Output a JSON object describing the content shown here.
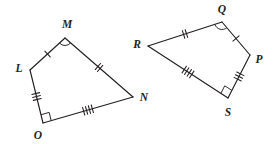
{
  "figure": {
    "stroke_color": "#231f20",
    "background_color": "#ffffff",
    "width": 273,
    "height": 144
  },
  "shapes": [
    {
      "name": "quadrilateral-lmno",
      "vertices": [
        {
          "label": "M",
          "x": 65,
          "y": 38,
          "label_x": 67,
          "label_y": 25
        },
        {
          "label": "N",
          "x": 133,
          "y": 97,
          "label_x": 144,
          "label_y": 98
        },
        {
          "label": "O",
          "x": 43,
          "y": 123,
          "label_x": 38,
          "label_y": 136
        },
        {
          "label": "L",
          "x": 30,
          "y": 70,
          "label_x": 19,
          "label_y": 69
        }
      ],
      "edges": [
        {
          "name": "edge-LM",
          "from": "L",
          "to": "M",
          "ticks": 1
        },
        {
          "name": "edge-MN",
          "from": "M",
          "to": "N",
          "ticks": 2
        },
        {
          "name": "edge-NO",
          "from": "N",
          "to": "O",
          "ticks": 4
        },
        {
          "name": "edge-OL",
          "from": "O",
          "to": "L",
          "ticks": 3
        }
      ],
      "angle_marks": [
        {
          "name": "angle-arc-M",
          "vertex": "M",
          "type": "arc"
        },
        {
          "name": "right-angle-O",
          "vertex": "O",
          "type": "right-angle"
        }
      ]
    },
    {
      "name": "quadrilateral-qpsr",
      "vertices": [
        {
          "label": "Q",
          "x": 222,
          "y": 22,
          "label_x": 222,
          "label_y": 10
        },
        {
          "label": "P",
          "x": 250,
          "y": 55,
          "label_x": 259,
          "label_y": 60
        },
        {
          "label": "S",
          "x": 228,
          "y": 98,
          "label_x": 228,
          "label_y": 113
        },
        {
          "label": "R",
          "x": 148,
          "y": 46,
          "label_x": 137,
          "label_y": 45
        }
      ],
      "edges": [
        {
          "name": "edge-RQ",
          "from": "R",
          "to": "Q",
          "ticks": 2
        },
        {
          "name": "edge-QP",
          "from": "Q",
          "to": "P",
          "ticks": 1
        },
        {
          "name": "edge-PS",
          "from": "P",
          "to": "S",
          "ticks": 3
        },
        {
          "name": "edge-SR",
          "from": "S",
          "to": "R",
          "ticks": 4
        }
      ],
      "angle_marks": [
        {
          "name": "angle-arc-Q",
          "vertex": "Q",
          "type": "arc"
        },
        {
          "name": "right-angle-S",
          "vertex": "S",
          "type": "right-angle"
        }
      ]
    }
  ]
}
